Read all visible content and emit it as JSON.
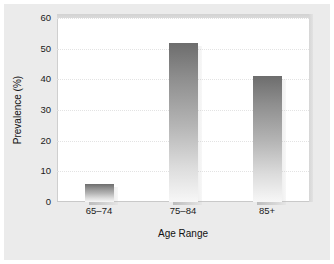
{
  "chart_data": {
    "type": "bar",
    "title": "",
    "subtitle": "",
    "categories": [
      "65–74",
      "75–84",
      "85+"
    ],
    "values": [
      6,
      52,
      41
    ],
    "series": [
      {
        "name": "Prevalence",
        "values": [
          6,
          52,
          41
        ]
      }
    ],
    "xlabel": "Age Range",
    "ylabel": "Prevalence (%)",
    "ylim": [
      0,
      60
    ],
    "yticks": [
      0,
      10,
      20,
      30,
      40,
      50,
      60
    ],
    "ytick_labels": [
      "0",
      "10",
      "20",
      "30",
      "40",
      "50",
      "60"
    ],
    "grid": true,
    "grid_axis": "y",
    "grid_style": "dotted",
    "legend": false,
    "legend_position": "none",
    "annotations": [],
    "colors": {
      "bar_top": "#6d6d6d",
      "bar_bottom": "#f7f7f7",
      "figure_background": "#ebebeb",
      "plot_background": "#ffffff",
      "gridline": "#e3e3e3",
      "text": "#1a1a1a"
    }
  }
}
